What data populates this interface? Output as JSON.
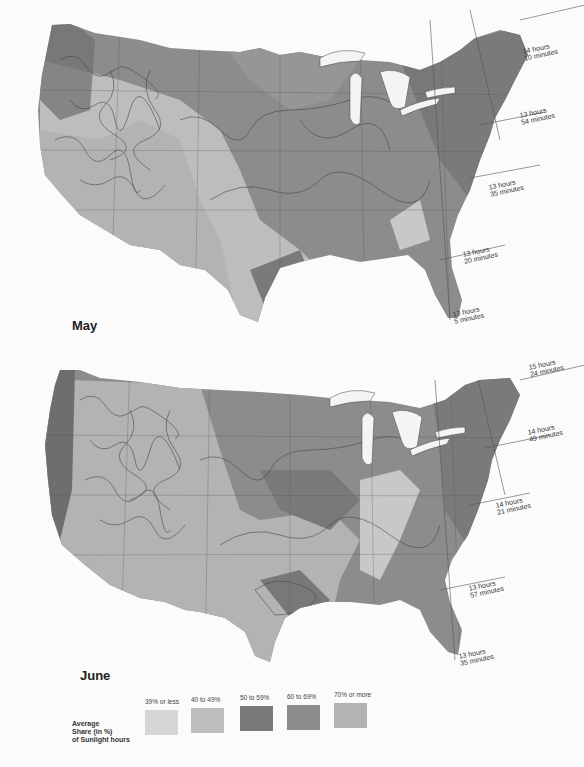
{
  "maps": [
    {
      "id": "may",
      "title": "May",
      "day_length_labels": [
        {
          "hours": "14 hours",
          "minutes": "10 minutes"
        },
        {
          "hours": "13 hours",
          "minutes": "54 minutes"
        },
        {
          "hours": "13 hours",
          "minutes": "35 minutes"
        },
        {
          "hours": "13 hours",
          "minutes": "20 minutes"
        },
        {
          "hours": "13 hours",
          "minutes": "5 minutes"
        }
      ]
    },
    {
      "id": "june",
      "title": "June",
      "day_length_labels": [
        {
          "hours": "15 hours",
          "minutes": "24 minutes"
        },
        {
          "hours": "14 hours",
          "minutes": "49 minutes"
        },
        {
          "hours": "14 hours",
          "minutes": "21 minutes"
        },
        {
          "hours": "13 hours",
          "minutes": "57 minutes"
        },
        {
          "hours": "13 hours",
          "minutes": "35 minutes"
        }
      ]
    }
  ],
  "legend": {
    "title_lines": [
      "Average",
      "Share (in %)",
      "of Sunlight hours"
    ],
    "items": [
      {
        "label": "39% or less",
        "color": "#d6d6d6"
      },
      {
        "label": "40 to 49%",
        "color": "#bdbdbd"
      },
      {
        "label": "50 to 59%",
        "color": "#7a7a7a"
      },
      {
        "label": "60 to 69%",
        "color": "#8c8c8c"
      },
      {
        "label": "70% or more",
        "color": "#b3b3b3"
      }
    ]
  }
}
